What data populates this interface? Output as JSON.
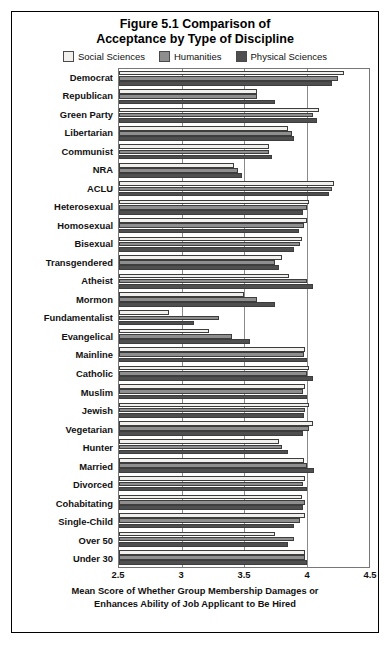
{
  "figure": {
    "title_line1": "Figure 5.1 Comparison of",
    "title_line2": "Acceptance by Type of Discipline",
    "caption_line1": "Mean Score of Whether Group Membership Damages or",
    "caption_line2": "Enhances Ability of Job Applicant to Be Hired"
  },
  "legend": {
    "entries": [
      {
        "label": "Social Sciences",
        "color": "#f2f0ec"
      },
      {
        "label": "Humanities",
        "color": "#8e8e8e"
      },
      {
        "label": "Physical Sciences",
        "color": "#4f4f4f"
      }
    ]
  },
  "axis": {
    "x_ticks": [
      "2.5",
      "3",
      "3.5",
      "4",
      "4.5"
    ],
    "x_min": 2.5,
    "x_max": 4.5
  },
  "chart_data": {
    "type": "bar",
    "orientation": "horizontal",
    "title": "Figure 5.1 Comparison of Acceptance by Type of Discipline",
    "xlabel": "Mean Score of Whether Group Membership Damages or Enhances Ability of Job Applicant to Be Hired",
    "ylabel": "",
    "xlim": [
      2.5,
      4.5
    ],
    "grid": true,
    "legend_position": "top",
    "categories": [
      "Democrat",
      "Republican",
      "Green Party",
      "Libertarian",
      "Communist",
      "NRA",
      "ACLU",
      "Heterosexual",
      "Homosexual",
      "Bisexual",
      "Transgendered",
      "Atheist",
      "Mormon",
      "Fundamentalist",
      "Evangelical",
      "Mainline",
      "Catholic",
      "Muslim",
      "Jewish",
      "Vegetarian",
      "Hunter",
      "Married",
      "Divorced",
      "Cohabitating",
      "Single-Child",
      "Over 50",
      "Under 30"
    ],
    "series": [
      {
        "name": "Social Sciences",
        "color": "#f2f0ec",
        "values": [
          4.3,
          3.6,
          4.1,
          3.85,
          3.7,
          3.42,
          4.22,
          4.02,
          4.0,
          3.96,
          3.8,
          3.86,
          3.5,
          2.9,
          3.22,
          3.99,
          4.02,
          3.99,
          4.02,
          4.05,
          3.78,
          3.98,
          3.99,
          3.96,
          3.99,
          3.75,
          3.99
        ]
      },
      {
        "name": "Humanities",
        "color": "#8e8e8e",
        "values": [
          4.25,
          3.6,
          4.05,
          3.88,
          3.7,
          3.45,
          4.2,
          4.0,
          3.98,
          3.95,
          3.75,
          4.0,
          3.6,
          3.3,
          3.4,
          3.98,
          4.0,
          3.97,
          3.99,
          4.02,
          3.8,
          4.0,
          3.97,
          3.99,
          3.95,
          3.9,
          3.99
        ]
      },
      {
        "name": "Physical Sciences",
        "color": "#4f4f4f",
        "values": [
          4.2,
          3.75,
          4.08,
          3.9,
          3.72,
          3.48,
          4.18,
          3.97,
          3.94,
          3.9,
          3.78,
          4.05,
          3.75,
          3.1,
          3.55,
          4.0,
          4.05,
          4.0,
          3.98,
          3.97,
          3.85,
          4.06,
          4.0,
          3.97,
          3.9,
          3.85,
          4.0
        ]
      }
    ]
  }
}
